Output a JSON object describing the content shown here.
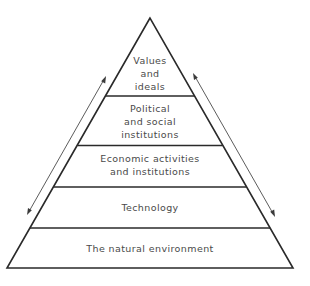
{
  "diagram": {
    "type": "pyramid",
    "layers": [
      {
        "id": "values",
        "lines": [
          "Values",
          "and",
          "ideals"
        ]
      },
      {
        "id": "political",
        "lines": [
          "Political",
          "and social",
          "institutions"
        ]
      },
      {
        "id": "economic",
        "lines": [
          "Economic activities",
          "and institutions"
        ]
      },
      {
        "id": "technology",
        "lines": [
          "Technology"
        ]
      },
      {
        "id": "environment",
        "lines": [
          "The natural environment"
        ]
      }
    ],
    "arrows": [
      {
        "id": "left",
        "style": "double-headed",
        "side": "left"
      },
      {
        "id": "right",
        "style": "double-headed",
        "side": "right"
      }
    ],
    "colors": {
      "line": "#2a2a2a",
      "text": "#4a4a4a",
      "background": "#ffffff"
    }
  }
}
